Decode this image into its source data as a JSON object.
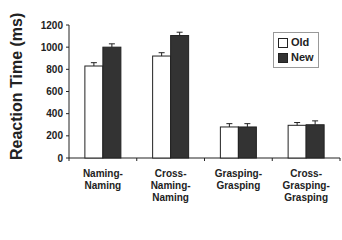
{
  "chart_data": {
    "type": "bar",
    "title": "",
    "xlabel": "",
    "ylabel": "Reaction Time (ms)",
    "ylim": [
      0,
      1200
    ],
    "yticks": [
      0,
      200,
      400,
      600,
      800,
      1000,
      1200
    ],
    "grid": false,
    "legend_position": "upper right",
    "categories": [
      "Naming-\nNaming",
      "Cross-\nNaming-\nNaming",
      "Grasping-\nGrasping",
      "Cross-\nGrasping-\nGrasping"
    ],
    "series": [
      {
        "name": "Old",
        "color": "#ffffff",
        "values": [
          830,
          920,
          280,
          295
        ],
        "errors": [
          30,
          30,
          30,
          25
        ]
      },
      {
        "name": "New",
        "color": "#333333",
        "values": [
          1000,
          1105,
          280,
          300
        ],
        "errors": [
          30,
          30,
          30,
          35
        ]
      }
    ]
  },
  "legend": {
    "old_label": "Old",
    "new_label": "New"
  },
  "axis": {
    "ylabel": "Reaction Time (ms)"
  }
}
